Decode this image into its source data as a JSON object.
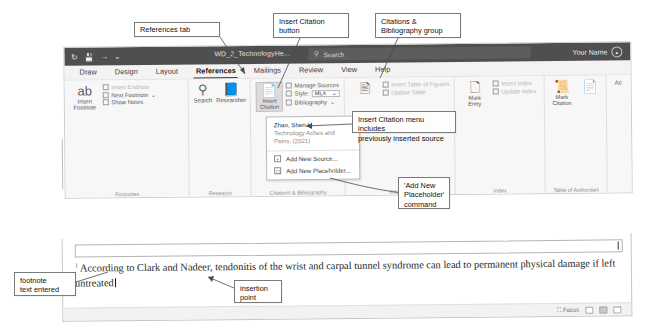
{
  "window": {
    "titlebar": {
      "autosave_icon": "undo-icon",
      "save_icon": "save-icon",
      "undo_icon": "undo-arrow-icon",
      "redo_icon": "redo-arrow-icon",
      "document_title": "WD_2_TechnologyHe...",
      "search_placeholder": "Search",
      "search_icon": "search-icon",
      "user_name": "Your Name",
      "avatar_icon": "user-avatar-icon"
    },
    "tabs": [
      {
        "label": "Draw",
        "active": false
      },
      {
        "label": "Design",
        "active": false
      },
      {
        "label": "Layout",
        "active": false
      },
      {
        "label": "References",
        "active": true
      },
      {
        "label": "Mailings",
        "active": false
      },
      {
        "label": "Review",
        "active": false
      },
      {
        "label": "View",
        "active": false
      },
      {
        "label": "Help",
        "active": false
      }
    ],
    "groups": {
      "footnotes": {
        "name": "Footnotes",
        "insert_footnote": "Insert\nFootnote",
        "insert_footnote_icon": "ab-superscript-icon",
        "insert_endnote": "Insert Endnote",
        "next_footnote": "Next Footnote",
        "show_notes": "Show Notes",
        "dialog_launcher": "dialog-launcher-icon"
      },
      "research": {
        "name": "Research",
        "search": "Search",
        "search_icon": "magnifier-circle-icon",
        "researcher": "Researcher",
        "researcher_icon": "book-icon"
      },
      "citations": {
        "name": "Citations & Bibliography",
        "insert_citation": "Insert\nCitation",
        "insert_citation_icon": "page-citation-icon",
        "manage_sources": "Manage Sources",
        "style_label": "Style:",
        "style_value": "MLA",
        "bibliography": "Bibliography"
      },
      "captions": {
        "name": "Captions",
        "insert_caption_icon": "caption-icon",
        "insert_table_of_figures": "Insert Table of Figures",
        "update_table": "Update Table"
      },
      "index": {
        "name": "Index",
        "mark_entry": "Mark\nEntry",
        "mark_entry_icon": "mark-entry-icon",
        "insert_index": "Insert Index",
        "update_index": "Update Index"
      },
      "authorities": {
        "name": "Table of Authorities",
        "mark_citation": "Mark\nCitation",
        "mark_citation_icon": "mark-citation-icon",
        "insert_toa_icon": "insert-table-of-authorities-icon"
      },
      "edge": {
        "label": "Ac"
      }
    }
  },
  "menu": {
    "source_name": "Zhao, Shen Li",
    "source_title": "Technology Aches and Pains, (2021)",
    "add_new_source": "Add New Source...",
    "add_new_source_icon": "add-source-icon",
    "add_new_placeholder": "Add New Placeholder...",
    "add_new_placeholder_icon": "add-placeholder-icon"
  },
  "document": {
    "body_line": "help reduce chances of developing repetitive strain injuries.",
    "footnote_text": "According to Clark and Nadeer, tendonitis of the wrist and carpal tunnel syndrome can lead to permanent physical damage if left untreated",
    "footnote_mark": "1"
  },
  "statusbar": {
    "focus": "Focus",
    "focus_icon": "focus-icon",
    "view_read": "read-mode-icon",
    "view_print": "print-layout-icon",
    "view_web": "web-layout-icon"
  },
  "callouts": {
    "references_tab": "References tab",
    "insert_citation_button": "Insert Citation\nbutton",
    "citations_group": "Citations &\nBibliography group",
    "menu_note": "Insert Citation menu includes\npreviously inserted source",
    "placeholder_note": "'Add New\nPlaceholder'\ncommand",
    "footnote_note": "footnote\ntext entered",
    "insertion_point": "insertion\npoint"
  }
}
